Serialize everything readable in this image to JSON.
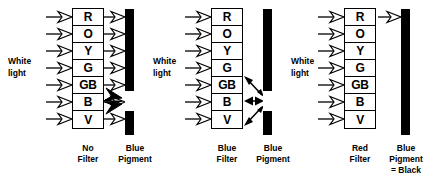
{
  "figure": {
    "spectrum_bands": [
      "R",
      "O",
      "Y",
      "G",
      "GB",
      "B",
      "V"
    ],
    "source_label": "White\nlight",
    "source_label_line1": "White",
    "source_label_line2": "light",
    "colors": {
      "ink": "#000000",
      "paper": "#ffffff",
      "pigment_bar": "#000000",
      "pigment_window": "#ffffff"
    }
  },
  "panels": [
    {
      "id": "no-filter",
      "filter_label_line1": "No",
      "filter_label_line2": "Filter",
      "pigment_label_line1": "Blue",
      "pigment_label_line2": "Pigment",
      "pigment_label_line3": "",
      "source_label_line1": "White",
      "source_label_line2": "light",
      "incoming_bands": [
        "R",
        "O",
        "Y",
        "G",
        "GB",
        "B",
        "V"
      ],
      "transmitted_bands": [
        "R",
        "O",
        "Y",
        "G",
        "GB",
        "B",
        "V"
      ],
      "reflected_bands": [
        "GB",
        "B",
        "V"
      ],
      "reflection_style": "solid-filled-arrows",
      "reflection_count": 3
    },
    {
      "id": "blue-filter",
      "filter_label_line1": "Blue",
      "filter_label_line2": "Filter",
      "pigment_label_line1": "Blue",
      "pigment_label_line2": "Pigment",
      "pigment_label_line3": "",
      "source_label_line1": "White",
      "source_label_line2": "light",
      "incoming_bands": [
        "R",
        "O",
        "Y",
        "G",
        "GB",
        "B",
        "V"
      ],
      "transmitted_bands": [],
      "reflected_bands": [
        "G",
        "B",
        "V"
      ],
      "reflection_style": "thin-double-headed-arrows",
      "reflection_count": 3
    },
    {
      "id": "red-filter",
      "filter_label_line1": "Red",
      "filter_label_line2": "Filter",
      "pigment_label_line1": "Blue",
      "pigment_label_line2": "Pigment",
      "pigment_label_line3": "= Black",
      "source_label_line1": "White",
      "source_label_line2": "light",
      "incoming_bands": [
        "R",
        "O",
        "Y",
        "G",
        "GB",
        "B",
        "V"
      ],
      "transmitted_bands": [
        "R"
      ],
      "reflected_bands": [],
      "reflection_style": "none",
      "reflection_count": 0
    }
  ]
}
